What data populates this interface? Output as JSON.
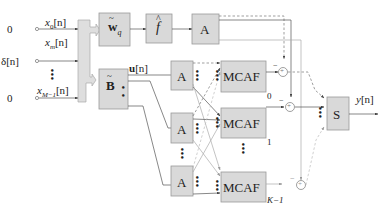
{
  "diagram": {
    "inputs": [
      {
        "source": "0",
        "label": "x_0[n]"
      },
      {
        "source": "δ[n]",
        "label": "x_m[n]"
      },
      {
        "source": "0",
        "label": "x_{M−1}[n]"
      }
    ],
    "blocks": {
      "wq": "w̃_q",
      "fhat": "f̂",
      "B": "B̃",
      "A": "A",
      "mcaf": "MCAF",
      "S": "S"
    },
    "signals": {
      "u": "u[n]",
      "y": "y[n]"
    },
    "mcaf_indices": [
      "0",
      "1",
      "K−1"
    ],
    "sum_sign": "−",
    "sum_symbol": "+",
    "labels": {
      "x0_sub": "0",
      "xm_sub": "m",
      "xM_sub": "M−1",
      "x_base": "x",
      "n_bracket": "[n]",
      "delta": "δ[n]",
      "zero": "0",
      "u_bold": "u",
      "y_base": "y",
      "w_bold": "w",
      "w_sub": "q",
      "f": "f",
      "B_bold": "B",
      "mcaf_k0": "0",
      "mcaf_k1": "1",
      "mcaf_kK": "K−1"
    }
  }
}
